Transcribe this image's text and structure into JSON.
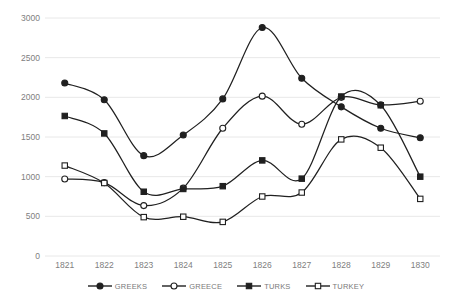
{
  "chart_data": {
    "type": "line",
    "title": "",
    "subtitle": "",
    "xlabel": "",
    "ylabel": "",
    "categories": [
      "1821",
      "1822",
      "1823",
      "1824",
      "1825",
      "1826",
      "1827",
      "1828",
      "1829",
      "1830"
    ],
    "ylim": [
      0,
      3000
    ],
    "yticks": [
      0,
      500,
      1000,
      1500,
      2000,
      2500,
      3000
    ],
    "ytick_labels": [
      "0",
      "500",
      "1000",
      "1500",
      "2000",
      "2500",
      "3000"
    ],
    "grid": true,
    "legend_position": "bottom",
    "smoothing": "spline",
    "series": [
      {
        "name": "GREEKS",
        "marker": "filled-circle",
        "color": "#202020",
        "values": [
          2180,
          1970,
          1265,
          1525,
          1980,
          2880,
          2240,
          1880,
          1610,
          1490
        ]
      },
      {
        "name": "GREECE",
        "marker": "open-circle",
        "color": "#202020",
        "values": [
          970,
          925,
          635,
          855,
          1610,
          2015,
          1660,
          2000,
          1905,
          1950
        ]
      },
      {
        "name": "TURKS",
        "marker": "filled-square",
        "color": "#202020",
        "values": [
          1765,
          1545,
          810,
          845,
          880,
          1205,
          975,
          2010,
          1900,
          1000
        ]
      },
      {
        "name": "TURKEY",
        "marker": "open-square",
        "color": "#202020",
        "values": [
          1140,
          920,
          490,
          495,
          430,
          750,
          800,
          1470,
          1365,
          720
        ]
      }
    ]
  },
  "axis": {
    "y_label_color": "#808080",
    "x_label_color": "#808080",
    "gridline_color": "#e8e8e8"
  },
  "legend": {
    "items": [
      {
        "label": "GREEKS",
        "marker": "filled-circle"
      },
      {
        "label": "GREECE",
        "marker": "open-circle"
      },
      {
        "label": "TURKS",
        "marker": "filled-square"
      },
      {
        "label": "TURKEY",
        "marker": "open-square"
      }
    ]
  }
}
